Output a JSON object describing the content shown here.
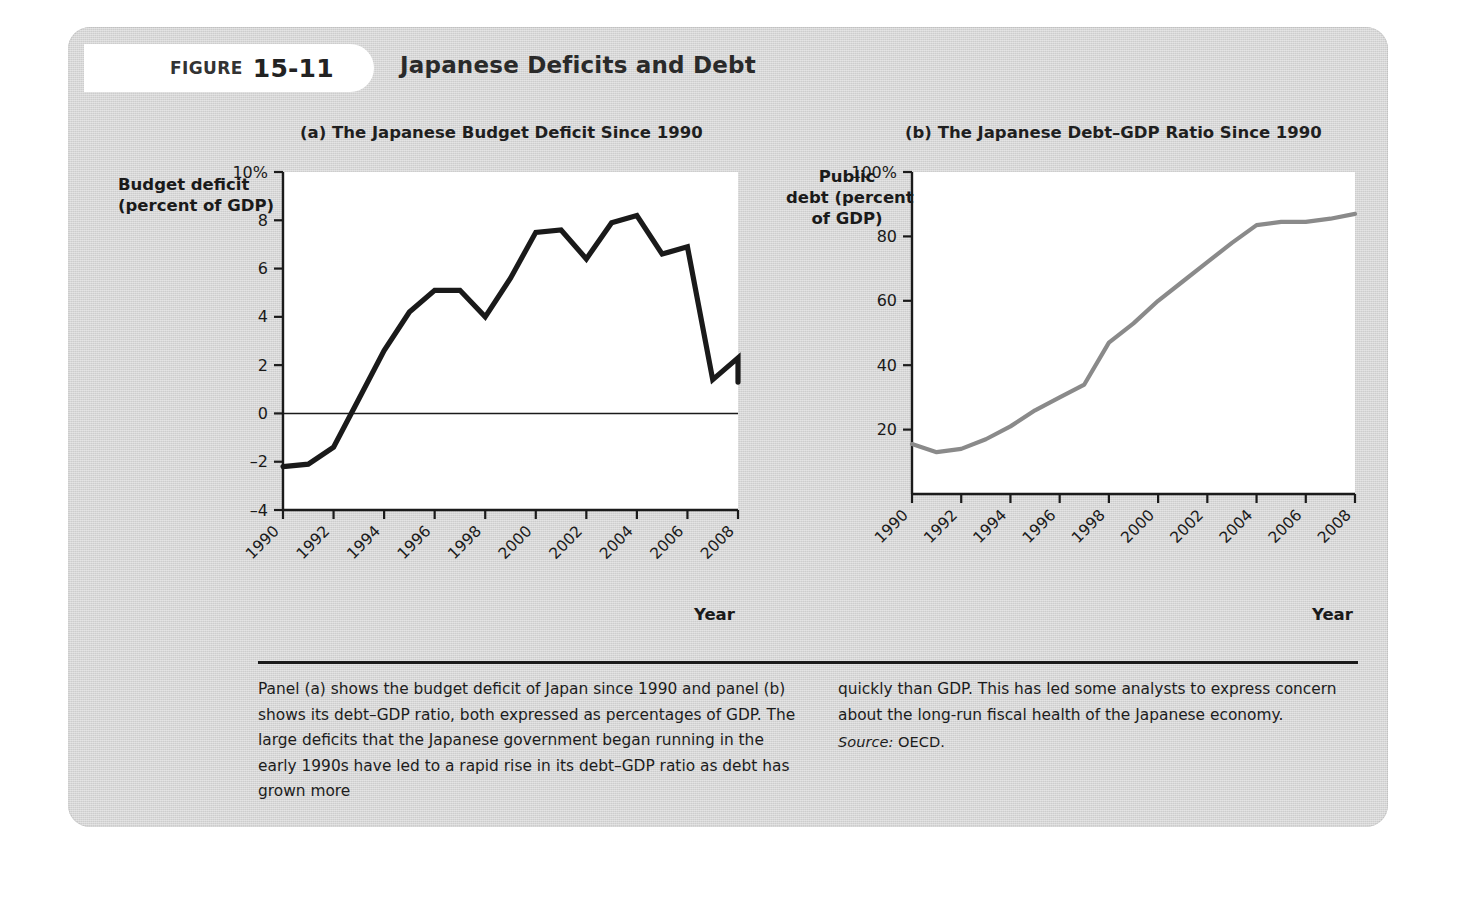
{
  "figure": {
    "label_word": "FIGURE",
    "number": "15-11",
    "title": "Japanese Deficits and Debt"
  },
  "panel_a": {
    "title": "(a) The Japanese Budget Deficit Since 1990",
    "y_axis_title_line1": "Budget deficit",
    "y_axis_title_line2": "(percent of GDP)",
    "x_axis_title": "Year"
  },
  "panel_b": {
    "title": "(b) The Japanese Debt–GDP Ratio Since 1990",
    "y_axis_title_line1": "Public",
    "y_axis_title_line2": "debt (percent",
    "y_axis_title_line3": "of GDP)",
    "x_axis_title": "Year"
  },
  "caption": {
    "left": "Panel (a) shows the budget deficit of Japan since 1990 and panel (b) shows its debt–GDP ratio, both expressed as percentages of GDP. The large deficits that the Japanese government began running in the early 1990s have led to a rapid rise in its debt–GDP ratio as debt has grown more",
    "right": "quickly than GDP. This has led some analysts to express concern about the long-run fiscal health of the Japanese economy.",
    "source_label": "Source:",
    "source_value": "OECD."
  },
  "colors": {
    "panel_background": "#d6d6d6",
    "plot_background": "#ffffff",
    "line_a": "#1a1a1a",
    "line_b": "#8a8a8a",
    "axis": "#1b1b1b",
    "zero_line": "#1b1b1b"
  },
  "chart_data": [
    {
      "type": "line",
      "panel": "a",
      "title": "(a) The Japanese Budget Deficit Since 1990",
      "xlabel": "Year",
      "ylabel": "Budget deficit (percent of GDP)",
      "xlim": [
        1990,
        2008
      ],
      "ylim": [
        -4,
        10
      ],
      "yticks": [
        -4,
        -2,
        0,
        2,
        4,
        6,
        8,
        10
      ],
      "ytick_labels": [
        "–4",
        "–2",
        "0",
        "2",
        "4",
        "6",
        "8",
        "10%"
      ],
      "xticks": [
        1990,
        1992,
        1994,
        1996,
        1998,
        2000,
        2002,
        2004,
        2006,
        2008
      ],
      "xtick_labels": [
        "1990",
        "1992",
        "1994",
        "1996",
        "1998",
        "2000",
        "2002",
        "2004",
        "2006",
        "2008"
      ],
      "grid": false,
      "legend": "none",
      "zero_line": true,
      "x": [
        1990,
        1991,
        1992,
        1993,
        1994,
        1995,
        1996,
        1997,
        1998,
        1999,
        2000,
        2001,
        2002,
        2003,
        2004,
        2005,
        2006,
        2007,
        2008
      ],
      "values": [
        -2.2,
        -2.1,
        -1.4,
        0.6,
        2.6,
        4.2,
        5.1,
        5.1,
        4.0,
        5.6,
        7.5,
        7.6,
        6.4,
        7.9,
        8.2,
        6.6,
        6.9,
        1.4,
        2.3,
        1.3
      ]
    },
    {
      "type": "line",
      "panel": "b",
      "title": "(b) The Japanese Debt–GDP Ratio Since 1990",
      "xlabel": "Year",
      "ylabel": "Public debt (percent of GDP)",
      "xlim": [
        1990,
        2008
      ],
      "ylim": [
        0,
        100
      ],
      "yticks": [
        20,
        40,
        60,
        80,
        100
      ],
      "ytick_labels": [
        "20",
        "40",
        "60",
        "80",
        "100%"
      ],
      "xticks": [
        1990,
        1992,
        1994,
        1996,
        1998,
        2000,
        2002,
        2004,
        2006,
        2008
      ],
      "xtick_labels": [
        "1990",
        "1992",
        "1994",
        "1996",
        "1998",
        "2000",
        "2002",
        "2004",
        "2006",
        "2008"
      ],
      "grid": false,
      "legend": "none",
      "x": [
        1990,
        1991,
        1992,
        1993,
        1994,
        1995,
        1996,
        1997,
        1998,
        1999,
        2000,
        2001,
        2002,
        2003,
        2004,
        2005,
        2006,
        2007,
        2008
      ],
      "values": [
        15.5,
        13.0,
        14.0,
        17.0,
        21.0,
        26.0,
        30.0,
        34.0,
        47.0,
        53.0,
        60.0,
        66.0,
        72.0,
        78.0,
        83.5,
        84.5,
        84.5,
        85.5,
        87.0
      ]
    }
  ]
}
